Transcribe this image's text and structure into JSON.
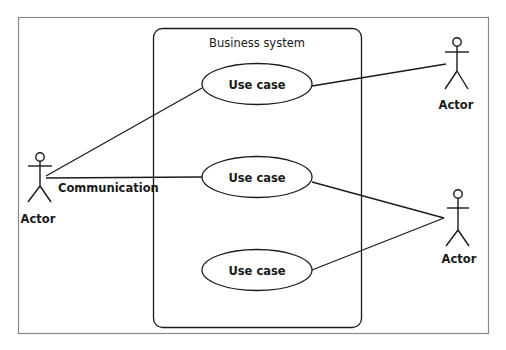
{
  "diagram": {
    "type": "uml-use-case",
    "system": {
      "label": "Business system"
    },
    "use_cases": [
      {
        "id": "uc1",
        "label": "Use case"
      },
      {
        "id": "uc2",
        "label": "Use case"
      },
      {
        "id": "uc3",
        "label": "Use case"
      }
    ],
    "actors": [
      {
        "id": "actor-left",
        "label": "Actor"
      },
      {
        "id": "actor-top-right",
        "label": "Actor"
      },
      {
        "id": "actor-bottom-right",
        "label": "Actor"
      }
    ],
    "associations": [
      {
        "from": "actor-left",
        "to": "uc1"
      },
      {
        "from": "actor-left",
        "to": "uc2",
        "label": "Communication"
      },
      {
        "from": "actor-top-right",
        "to": "uc1"
      },
      {
        "from": "actor-bottom-right",
        "to": "uc2"
      },
      {
        "from": "actor-bottom-right",
        "to": "uc3"
      }
    ],
    "colors": {
      "stroke": "#1a1a1a",
      "frame": "#8a8a8a",
      "background": "#ffffff"
    }
  }
}
